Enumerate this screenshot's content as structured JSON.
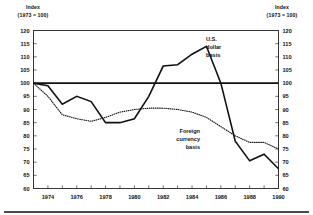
{
  "chart_data": {
    "type": "line",
    "title": "",
    "xlabel": "",
    "ylabel": "Index (1973 = 100)",
    "ylabel_left_line1": "Index",
    "ylabel_left_line2": "(1973 = 100)",
    "ylabel_right_line1": "Index",
    "ylabel_right_line2": "(1973 = 100)",
    "ylim": [
      60,
      120
    ],
    "xlim": [
      1973,
      1990
    ],
    "ytick_labels": [
      "120",
      "115",
      "110",
      "105",
      "100",
      "95",
      "90",
      "85",
      "80",
      "75",
      "70",
      "65",
      "60"
    ],
    "ytick_values": [
      120,
      115,
      110,
      105,
      100,
      95,
      90,
      85,
      80,
      75,
      70,
      65,
      60
    ],
    "xtick_labels": [
      "1974",
      "1976",
      "1978",
      "1980",
      "1982",
      "1984",
      "1986",
      "1988",
      "1990"
    ],
    "xtick_values": [
      1974,
      1976,
      1978,
      1980,
      1982,
      1984,
      1986,
      1988,
      1990
    ],
    "xtick_minor": [
      1973,
      1975,
      1977,
      1979,
      1981,
      1983,
      1985,
      1987,
      1989
    ],
    "grid": false,
    "legend_position": "inline-annotations",
    "reference_line": 100,
    "x": [
      1973,
      1974,
      1975,
      1976,
      1977,
      1978,
      1979,
      1980,
      1981,
      1982,
      1983,
      1984,
      1985,
      1986,
      1987,
      1988,
      1989,
      1990
    ],
    "series": [
      {
        "name": "U.S. dollar basis",
        "style": "solid",
        "color": "#111111",
        "values": [
          100.0,
          99.0,
          92.0,
          95.0,
          93.0,
          85.0,
          85.0,
          86.5,
          95.0,
          106.5,
          107.0,
          111.0,
          114.0,
          100.0,
          78.0,
          70.5,
          73.0,
          67.5
        ]
      },
      {
        "name": "Foreign currency basis",
        "style": "dotted",
        "color": "#111111",
        "values": [
          100.0,
          95.0,
          88.0,
          86.5,
          85.5,
          87.0,
          89.0,
          90.0,
          90.5,
          90.5,
          90.0,
          89.0,
          87.0,
          83.5,
          80.0,
          77.5,
          77.5,
          75.0
        ]
      }
    ],
    "annotations": [
      {
        "name": "us-dollar-basis",
        "lines": [
          "U.S.",
          "dollar",
          "basis"
        ],
        "align": "left",
        "x_px": 206,
        "y_px": 41
      },
      {
        "name": "foreign-currency-basis",
        "lines": [
          "Foreign",
          "currency",
          "basis"
        ],
        "align": "right",
        "x_px": 200,
        "y_px": 133
      }
    ]
  }
}
